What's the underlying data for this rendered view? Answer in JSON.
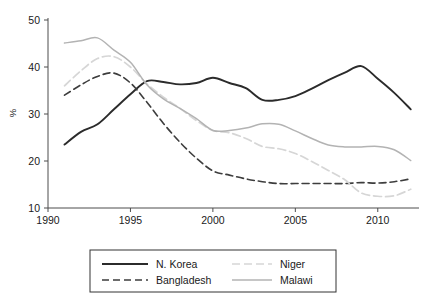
{
  "chart_data": {
    "type": "line",
    "title": "",
    "subtitle": "",
    "xlabel": "",
    "ylabel": "%",
    "xlim": [
      1990,
      2012.5
    ],
    "ylim": [
      8,
      51
    ],
    "grid": false,
    "legend_position": "bottom",
    "x_ticks": [
      1990,
      1995,
      2000,
      2005,
      2010
    ],
    "x_tick_labels": [
      "1990",
      "1995",
      "2000",
      "2005",
      "2010"
    ],
    "y_ticks": [
      10,
      20,
      30,
      40,
      50
    ],
    "y_tick_labels": [
      "10",
      "20",
      "30",
      "40",
      "50"
    ],
    "x": [
      1991,
      1992,
      1993,
      1994,
      1995,
      1996,
      1997,
      1998,
      1999,
      2000,
      2001,
      2002,
      2003,
      2004,
      2005,
      2006,
      2007,
      2008,
      2009,
      2010,
      2011,
      2012
    ],
    "series": [
      {
        "name": "N. Korea",
        "style": "solid",
        "color": "#2b2b2b",
        "width": 1.9,
        "values": [
          23.5,
          26.2,
          27.8,
          31.0,
          34.2,
          37.0,
          36.8,
          36.3,
          36.6,
          37.7,
          36.6,
          35.5,
          33.0,
          33.0,
          33.8,
          35.4,
          37.2,
          38.8,
          40.2,
          37.5,
          34.5,
          31.0
        ]
      },
      {
        "name": "Bangladesh",
        "style": "dashed",
        "color": "#3d3d3d",
        "width": 1.6,
        "values": [
          34.0,
          36.2,
          38.0,
          38.7,
          36.6,
          32.5,
          28.0,
          24.0,
          20.6,
          17.9,
          17.0,
          16.2,
          15.6,
          15.2,
          15.2,
          15.2,
          15.2,
          15.2,
          15.4,
          15.3,
          15.6,
          16.2
        ]
      },
      {
        "name": "Niger",
        "style": "dashed-light",
        "color": "#d6d6d6",
        "width": 1.7,
        "values": [
          36.0,
          39.2,
          41.8,
          42.2,
          40.0,
          36.4,
          33.6,
          31.2,
          28.6,
          26.5,
          26.0,
          24.8,
          23.1,
          22.6,
          21.6,
          19.9,
          18.0,
          16.0,
          13.2,
          12.5,
          12.6,
          14.0
        ]
      },
      {
        "name": "Malawi",
        "style": "solid-light",
        "color": "#b3b3b3",
        "width": 1.5,
        "values": [
          45.1,
          45.6,
          46.2,
          43.6,
          41.0,
          36.2,
          33.2,
          31.2,
          29.0,
          26.5,
          26.5,
          27.0,
          27.9,
          27.8,
          26.4,
          24.8,
          23.4,
          23.0,
          23.0,
          23.1,
          22.4,
          20.1
        ]
      }
    ]
  },
  "legend": {
    "entries": [
      {
        "label": "N. Korea"
      },
      {
        "label": "Bangladesh"
      },
      {
        "label": "Niger"
      },
      {
        "label": "Malawi"
      }
    ]
  },
  "axis": {
    "y_title": "%"
  }
}
